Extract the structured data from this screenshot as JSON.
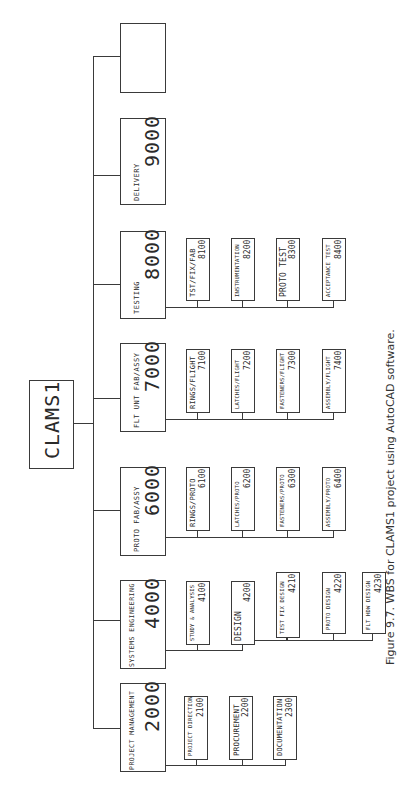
{
  "diagram": {
    "root": {
      "label": "CLAMS1"
    },
    "level1": [
      {
        "name": "",
        "code": ""
      },
      {
        "name": "DELIVERY",
        "code": "9000"
      },
      {
        "name": "TESTING",
        "code": "8000"
      },
      {
        "name": "FLT UNT FAB/ASSY",
        "code": "7000"
      },
      {
        "name": "PROTO FAB/ASSY",
        "code": "6000"
      },
      {
        "name": "SYSTEMS ENGINEERING",
        "code": "4000"
      },
      {
        "name": "PROJECT MANAGEMENT",
        "code": "2000"
      }
    ],
    "testing_children": [
      {
        "name": "TST/FIX/FAB",
        "code": "8100"
      },
      {
        "name": "INSTRUMENTATION",
        "code": "8200"
      },
      {
        "name": "PROTO TEST",
        "code": "8300"
      },
      {
        "name": "ACCEPTANCE TEST",
        "code": "8400"
      }
    ],
    "flt_unt_children": [
      {
        "name": "RINGS/FLIGHT",
        "code": "7100"
      },
      {
        "name": "LATCHES/FLIGHT",
        "code": "7200"
      },
      {
        "name": "FASTENERS/FLIGHT",
        "code": "7300"
      },
      {
        "name": "ASSEMBLY/FLIGHT",
        "code": "7400"
      }
    ],
    "proto_children": [
      {
        "name": "RINGS/PROTO",
        "code": "6100"
      },
      {
        "name": "LATCHES/PROTO",
        "code": "6200"
      },
      {
        "name": "FASTENERS/PROTO",
        "code": "6300"
      },
      {
        "name": "ASSEMBLY/PROTO",
        "code": "6400"
      }
    ],
    "syseng_children": [
      {
        "name": "STUDY & ANALYSIS",
        "code": "4100"
      },
      {
        "name": "DESIGN",
        "code": "4200"
      },
      {
        "name": "TEST FIX DESIGN",
        "code": "4210"
      },
      {
        "name": "PROTO DESIGN",
        "code": "4220"
      },
      {
        "name": "FLT HDW DESIGN",
        "code": "4230"
      }
    ],
    "pm_children": [
      {
        "name": "PROJECT DIRECTION",
        "code": "2100"
      },
      {
        "name": "PROCUREMENT",
        "code": "2200"
      },
      {
        "name": "DOCUMENTATION",
        "code": "2300"
      }
    ]
  },
  "caption": "Figure 9.7.  WBS for CLAMS1 project using AutoCAD software."
}
